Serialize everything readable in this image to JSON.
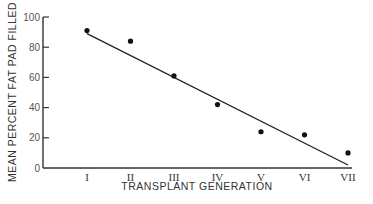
{
  "chart_data": {
    "type": "scatter",
    "title": "",
    "xlabel": "TRANSPLANT GENERATION",
    "ylabel": "MEAN PERCENT FAT PAD FILLED",
    "categories": [
      "I",
      "II",
      "III",
      "IV",
      "V",
      "VI",
      "VII"
    ],
    "series": [
      {
        "name": "Observed",
        "type": "scatter",
        "values": [
          91,
          84,
          61,
          42,
          24,
          22,
          10
        ]
      },
      {
        "name": "Regression line",
        "type": "line",
        "x_start": "I",
        "y_start": 89,
        "x_end": "VII",
        "y_end": 2
      }
    ],
    "yticks": [
      0,
      20,
      40,
      60,
      80,
      100
    ],
    "ylim": [
      0,
      100
    ],
    "grid": false,
    "legend": "none"
  }
}
